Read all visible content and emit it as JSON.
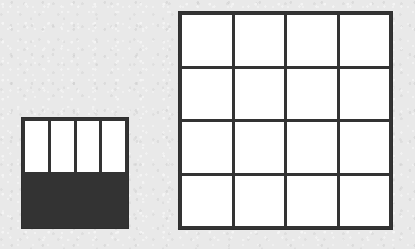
{
  "figure": {
    "background_color": "#e9e9e9",
    "line_color": "#333333",
    "cell_color": "#ffffff"
  },
  "grids": [
    {
      "id": "grid-small",
      "name": "small-grid",
      "rows": 2,
      "columns": 4,
      "cell_count": 4,
      "position": {
        "x": 21,
        "y": 117
      },
      "size": {
        "width": 108,
        "height": 112
      },
      "cells": [
        {
          "row": 1,
          "col": 1,
          "label": ""
        },
        {
          "row": 1,
          "col": 2,
          "label": ""
        },
        {
          "row": 2,
          "col": 1,
          "label": ""
        },
        {
          "row": 2,
          "col": 2,
          "label": ""
        }
      ]
    },
    {
      "id": "grid-large",
      "name": "large-grid",
      "rows": 4,
      "columns": 4,
      "cell_count": 16,
      "position": {
        "x": 178,
        "y": 11
      },
      "size": {
        "width": 215,
        "height": 219
      },
      "cells": [
        {
          "row": 1,
          "col": 1,
          "label": ""
        },
        {
          "row": 1,
          "col": 2,
          "label": ""
        },
        {
          "row": 1,
          "col": 3,
          "label": ""
        },
        {
          "row": 1,
          "col": 4,
          "label": ""
        },
        {
          "row": 2,
          "col": 1,
          "label": ""
        },
        {
          "row": 2,
          "col": 2,
          "label": ""
        },
        {
          "row": 2,
          "col": 3,
          "label": ""
        },
        {
          "row": 2,
          "col": 4,
          "label": ""
        },
        {
          "row": 3,
          "col": 1,
          "label": ""
        },
        {
          "row": 3,
          "col": 2,
          "label": ""
        },
        {
          "row": 3,
          "col": 3,
          "label": ""
        },
        {
          "row": 3,
          "col": 4,
          "label": ""
        },
        {
          "row": 4,
          "col": 1,
          "label": ""
        },
        {
          "row": 4,
          "col": 2,
          "label": ""
        },
        {
          "row": 4,
          "col": 3,
          "label": ""
        },
        {
          "row": 4,
          "col": 4,
          "label": ""
        }
      ]
    }
  ]
}
